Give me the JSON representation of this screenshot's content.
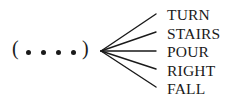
{
  "diagram": {
    "open_paren": "(",
    "close_paren": ")",
    "dot_count": 4,
    "words": [
      "TURN",
      "STAIRS",
      "POUR",
      "RIGHT",
      "FALL"
    ],
    "ink_color": "#1a1a1a"
  }
}
